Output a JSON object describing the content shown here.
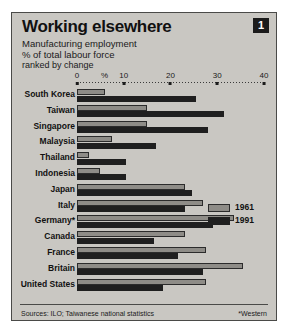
{
  "figure": {
    "badge": "1",
    "title": "Working elsewhere",
    "subtitle_1": "Manufacturing employment",
    "subtitle_2": "% of total labour force",
    "subtitle_3": "ranked by change",
    "source_note": "Sources: ILO; Taiwanese national statistics",
    "footnote": "*Western",
    "colors": {
      "panel_background": "#c9c7c2",
      "series_1961": "#8e8c87",
      "series_1991": "#1f1f1f",
      "text": "#111111",
      "badge_background": "#1b1b1b"
    }
  },
  "axis": {
    "percent_symbol": "%",
    "ticks": [
      "0",
      "10",
      "20",
      "30",
      "40"
    ]
  },
  "legend": {
    "items": [
      {
        "label": "1961",
        "swatch": "sw-1961"
      },
      {
        "label": "1991",
        "swatch": "sw-1991"
      }
    ]
  },
  "chart_data": {
    "type": "bar",
    "orientation": "horizontal",
    "title": "Working elsewhere",
    "subtitle": "Manufacturing employment, % of total labour force, ranked by change",
    "xlabel": "%",
    "ylabel": "",
    "xlim": [
      0,
      40
    ],
    "xticks": [
      0,
      10,
      20,
      30,
      40
    ],
    "grid": false,
    "legend_position": "middle-right",
    "sorted_by": "change",
    "source": "Sources: ILO; Taiwanese national statistics",
    "footnote": "*Western",
    "categories": [
      "South Korea",
      "Taiwan",
      "Singapore",
      "Malaysia",
      "Thailand",
      "Indonesia",
      "Japan",
      "Italy",
      "Germany*",
      "Canada",
      "France",
      "Britain",
      "United States"
    ],
    "series": [
      {
        "name": "1961",
        "color": "#8e8c87",
        "values": [
          6,
          15,
          15,
          7.5,
          2.5,
          5,
          23,
          27,
          33.5,
          23,
          27.5,
          35.5,
          27.5
        ]
      },
      {
        "name": "1991",
        "color": "#1f1f1f",
        "values": [
          25.5,
          31.5,
          28,
          17,
          10.5,
          10.5,
          24.5,
          23,
          29,
          16.5,
          21.5,
          27,
          18.5
        ]
      }
    ]
  }
}
